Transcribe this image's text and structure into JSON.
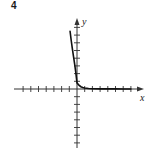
{
  "problem": {
    "number": "4"
  },
  "colors": {
    "axis": "#333333",
    "curve": "#111111",
    "background": "#ffffff"
  },
  "chart_data": {
    "type": "line",
    "title": "",
    "xlabel": "x",
    "ylabel": "y",
    "grid": false,
    "legend": null,
    "xlim": [
      -8,
      8
    ],
    "ylim": [
      -8,
      9
    ],
    "x_ticks": [
      -7,
      -6,
      -5,
      -4,
      -3,
      -2,
      -1,
      1,
      2,
      3,
      4,
      5,
      6,
      7
    ],
    "y_ticks": [
      -7,
      -6,
      -5,
      -4,
      -3,
      -2,
      -1,
      1,
      2,
      3,
      4,
      5,
      6,
      7,
      8
    ],
    "tick_labels_shown": false,
    "series": [
      {
        "name": "exponential decay curve",
        "x": [
          -0.9,
          -0.75,
          -0.6,
          -0.45,
          -0.3,
          -0.15,
          0,
          0.25,
          0.5,
          0.75,
          1,
          1.5,
          2,
          3,
          4,
          5,
          6,
          7
        ],
        "y": [
          7.5,
          6.3,
          5.2,
          4.2,
          3.2,
          2.1,
          0.8,
          0.5,
          0.3,
          0.2,
          0.13,
          0.07,
          0.04,
          0.02,
          0.01,
          0.01,
          0.0,
          0.0
        ]
      }
    ],
    "annotations": [
      "4"
    ]
  }
}
